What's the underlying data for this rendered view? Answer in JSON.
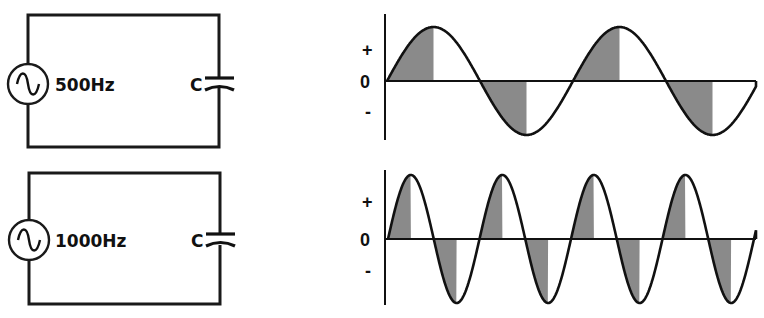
{
  "circuits": [
    {
      "id": "top",
      "source_label": "500Hz",
      "capacitor_label": "C",
      "frequency_hz": 500,
      "rect": {
        "x1": 28,
        "y1": 15,
        "x2": 219,
        "y2": 147
      },
      "source_center_y": 84,
      "cap_y": 82
    },
    {
      "id": "bottom",
      "source_label": "1000Hz",
      "capacitor_label": "C",
      "frequency_hz": 1000,
      "rect": {
        "x1": 29,
        "y1": 173,
        "x2": 220,
        "y2": 304
      },
      "source_center_y": 240,
      "cap_y": 240
    }
  ],
  "graphs": [
    {
      "id": "graph-500hz",
      "axis_x": 385,
      "axis_top": 14,
      "axis_bottom": 140,
      "zero_y": 81,
      "amplitude": 54,
      "start_x": 387,
      "end_x": 756,
      "period_px": 186,
      "labels": {
        "plus": "+",
        "zero": "0",
        "minus": "-"
      },
      "label_y": {
        "plus": 56,
        "zero": 88,
        "minus": 118
      }
    },
    {
      "id": "graph-1000hz",
      "axis_x": 385,
      "axis_top": 170,
      "axis_bottom": 305,
      "zero_y": 239,
      "amplitude": 64,
      "start_x": 388,
      "end_x": 756,
      "period_px": 91.5,
      "labels": {
        "plus": "+",
        "zero": "0",
        "minus": "-"
      },
      "label_y": {
        "plus": 208,
        "zero": 246,
        "minus": 277
      }
    }
  ],
  "colors": {
    "ink": "#111111",
    "shade": "#8a8a8a",
    "background": "#ffffff"
  }
}
